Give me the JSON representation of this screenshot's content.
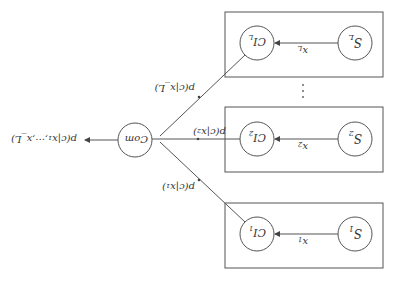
{
  "diagram": {
    "orientation": "rotated-180",
    "sources": [
      {
        "id": "S1",
        "label": "S",
        "sub": "1",
        "signal": "x",
        "signal_sub": "1",
        "classifier": "CI",
        "classifier_sub": "1",
        "edge_label": "p(c|x₁)"
      },
      {
        "id": "S2",
        "label": "S",
        "sub": "2",
        "signal": "x",
        "signal_sub": "2",
        "classifier": "CI",
        "classifier_sub": "2",
        "edge_label": "p(c|x₂)"
      },
      {
        "id": "SL",
        "label": "S",
        "sub": "L",
        "signal": "x",
        "signal_sub": "L",
        "classifier": "CI",
        "classifier_sub": "L",
        "edge_label": "p(c|x_L)"
      }
    ],
    "combiner": {
      "label": "Com"
    },
    "output_label": "p(c|x₁,···,x_L)",
    "ellipsis": "⋮"
  }
}
